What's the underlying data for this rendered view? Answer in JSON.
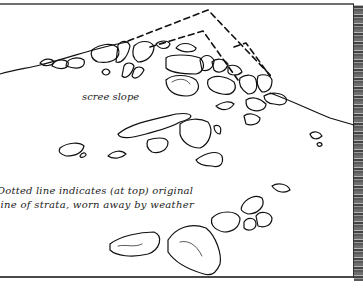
{
  "figure": {
    "labels": {
      "scree": "scree slope",
      "caption_line1": "Dotted line indicates (at top) original",
      "caption_line2": "line of strata, worn away by weather"
    },
    "colors": {
      "ink": "#111111",
      "paper": "#ffffff",
      "frame": "#555555",
      "rock_strip": "#777777"
    }
  }
}
